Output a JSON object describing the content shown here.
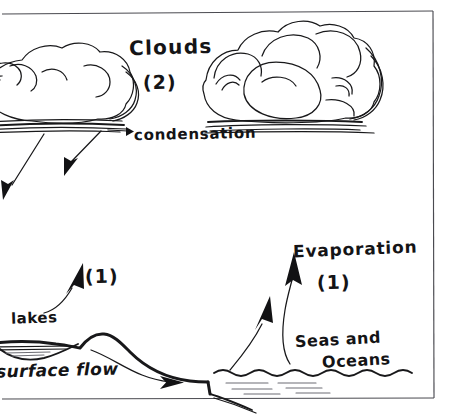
{
  "diagram": {
    "background_color": "#ffffff",
    "ink_color": "#18181a",
    "frame_color": "#4a4a50"
  },
  "labels": {
    "clouds": "Clouds",
    "clouds_number": "(2)",
    "condensation": "condensation",
    "evaporation": "Evaporation",
    "evaporation_number": "(1)",
    "lakes": "lakes",
    "lakes_number": "(1)",
    "surface_flow": "surface flow",
    "seas_line1": "Seas and",
    "seas_line2": "Oceans"
  },
  "elements": {
    "cloud_left": "cloud-left-shape",
    "cloud_right": "cloud-right-shape",
    "precipitation_arrow_1": "precipitation-arrow",
    "precipitation_arrow_2": "precipitation-arrow",
    "condensation_arrow": "condensation-pointer-arrow",
    "lakes_arrow": "lakes-evaporation-arrow",
    "evaporation_arrow_1": "evaporation-arrow",
    "evaporation_arrow_2": "evaporation-arrow",
    "surface_flow_arrow": "surface-flow-arrow",
    "terrain": "terrain-profile",
    "lake_basin": "lake-basin",
    "sea_surface": "sea-wavy-surface",
    "frame": "diagram-frame-border"
  }
}
